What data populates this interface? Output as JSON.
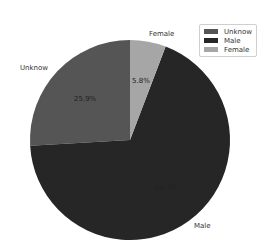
{
  "chart_data": {
    "type": "pie",
    "title": "",
    "categories": [
      "Unknow",
      "Male",
      "Female"
    ],
    "values": [
      25.9,
      68.3,
      5.8
    ],
    "labels_pct": [
      "25.9%",
      "68.3%",
      "5.8%"
    ],
    "colors": [
      "#555555",
      "#262626",
      "#a6a6a6"
    ],
    "startangle": 90,
    "direction": "counterclockwise",
    "legend": {
      "entries": [
        "Unknow",
        "Male",
        "Female"
      ],
      "position": "upper right"
    }
  },
  "legend": {
    "items": [
      {
        "label": "Unknow",
        "color": "#555555"
      },
      {
        "label": "Male",
        "color": "#262626"
      },
      {
        "label": "Female",
        "color": "#a6a6a6"
      }
    ]
  },
  "slices": {
    "unknow": {
      "label": "Unknow",
      "pct": "25.9%"
    },
    "male": {
      "label": "Male",
      "pct": "68.3%"
    },
    "female": {
      "label": "Female",
      "pct": "5.8%"
    }
  }
}
